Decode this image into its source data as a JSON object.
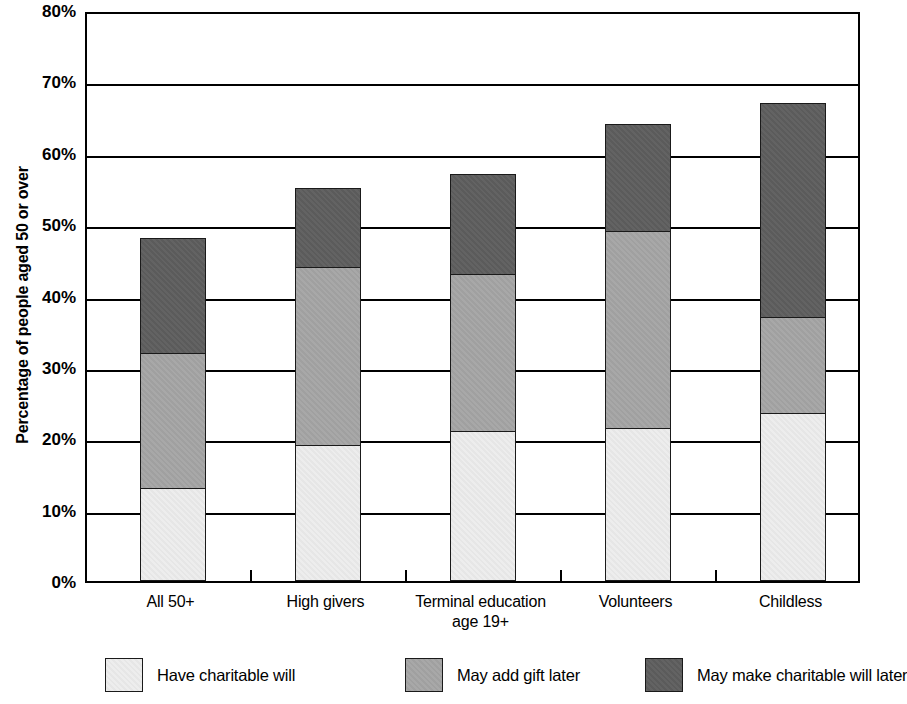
{
  "chart_data": {
    "type": "bar",
    "subtype": "stacked-vertical",
    "title": "",
    "xlabel": "",
    "ylabel": "Percentage of people aged 50 or over",
    "ylim": [
      0,
      80
    ],
    "ytick_labels": [
      "0%",
      "10%",
      "20%",
      "30%",
      "40%",
      "50%",
      "60%",
      "70%",
      "80%"
    ],
    "ytick_values": [
      0,
      10,
      20,
      30,
      40,
      50,
      60,
      70,
      80
    ],
    "grid": "horizontal",
    "legend_position": "bottom",
    "categories": [
      "All 50+",
      "High givers",
      "Terminal education age 19+",
      "Volunteers",
      "Childless"
    ],
    "category_lines": [
      [
        "All 50+",
        ""
      ],
      [
        "High givers",
        ""
      ],
      [
        "Terminal education",
        "age 19+"
      ],
      [
        "Volunteers",
        ""
      ],
      [
        "Childless",
        ""
      ]
    ],
    "series": [
      {
        "name": "Have charitable will",
        "color": "#ededed",
        "values": [
          13,
          19,
          21,
          21.5,
          23.5
        ]
      },
      {
        "name": "May add gift later",
        "color": "#a8a8a8",
        "values": [
          19,
          25,
          22,
          27.5,
          13.5
        ]
      },
      {
        "name": "May make charitable will later",
        "color": "#636363",
        "values": [
          16,
          11,
          14,
          15,
          30
        ]
      }
    ],
    "totals": [
      48,
      55,
      57,
      64,
      67
    ]
  },
  "axis": {
    "y_title": "Percentage of people aged 50 or over"
  },
  "legend": {
    "items": [
      {
        "label": "Have charitable will",
        "swatch": "light-gray-swatch"
      },
      {
        "label": "May add gift later",
        "swatch": "mid-gray-swatch"
      },
      {
        "label": "May make charitable will later",
        "swatch": "dark-gray-swatch"
      }
    ]
  }
}
